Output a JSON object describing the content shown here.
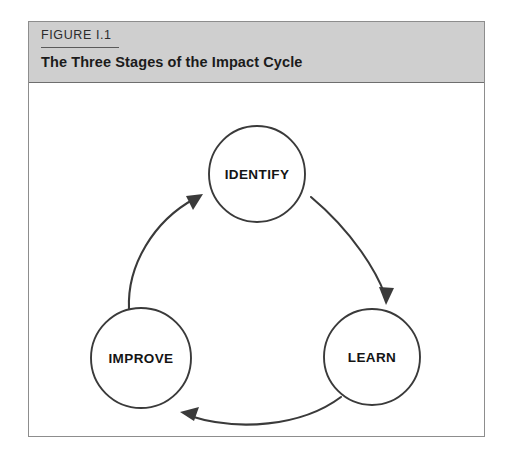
{
  "figure": {
    "number": "FIGURE I.1",
    "title": "The Three Stages of the Impact Cycle"
  },
  "diagram": {
    "type": "cycle",
    "nodes": [
      {
        "id": "identify",
        "label": "IDENTIFY",
        "cx": 228,
        "cy": 91,
        "r": 48
      },
      {
        "id": "learn",
        "label": "LEARN",
        "cx": 343,
        "cy": 274,
        "r": 48
      },
      {
        "id": "improve",
        "label": "IMPROVE",
        "cx": 112,
        "cy": 275,
        "r": 50
      }
    ],
    "arrows": [
      {
        "from": "identify",
        "to": "learn"
      },
      {
        "from": "learn",
        "to": "improve"
      },
      {
        "from": "improve",
        "to": "identify"
      }
    ]
  },
  "colors": {
    "header_background": "#cfcfcf",
    "frame_border": "#8d8d8d",
    "stroke": "#3a3a3a",
    "text": "#141414"
  }
}
